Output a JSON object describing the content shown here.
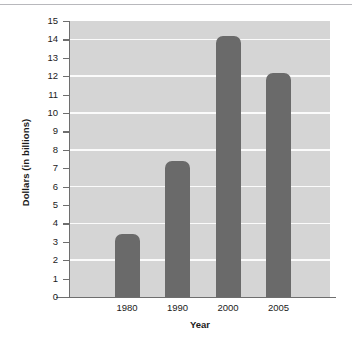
{
  "chart_data": {
    "type": "bar",
    "title": "",
    "xlabel": "Year",
    "ylabel": "Dollars (in billions)",
    "categories": [
      "1980",
      "1990",
      "2000",
      "2005"
    ],
    "values": [
      3.4,
      7.4,
      14.2,
      12.2
    ],
    "ylim": [
      0,
      15
    ],
    "ytick_labels": [
      "15",
      "14",
      "13",
      "12",
      "11",
      "10",
      "9",
      "8",
      "7",
      "6",
      "5",
      "4",
      "3",
      "2",
      "1",
      "0"
    ],
    "ytick_values": [
      15,
      14,
      13,
      12,
      11,
      10,
      9,
      8,
      7,
      6,
      5,
      4,
      3,
      2,
      1,
      0
    ],
    "gridline_values": [
      14,
      12,
      10,
      8,
      6,
      4,
      2
    ],
    "grid": true,
    "legend": "none",
    "colors": {
      "bar": "#6a6a6a",
      "plot_background": "#d5d5d5",
      "gridline": "#fbfbfb",
      "axis": "#6e6e6e",
      "text": "#1b1b1b",
      "figure_background": "#ffffff"
    }
  }
}
